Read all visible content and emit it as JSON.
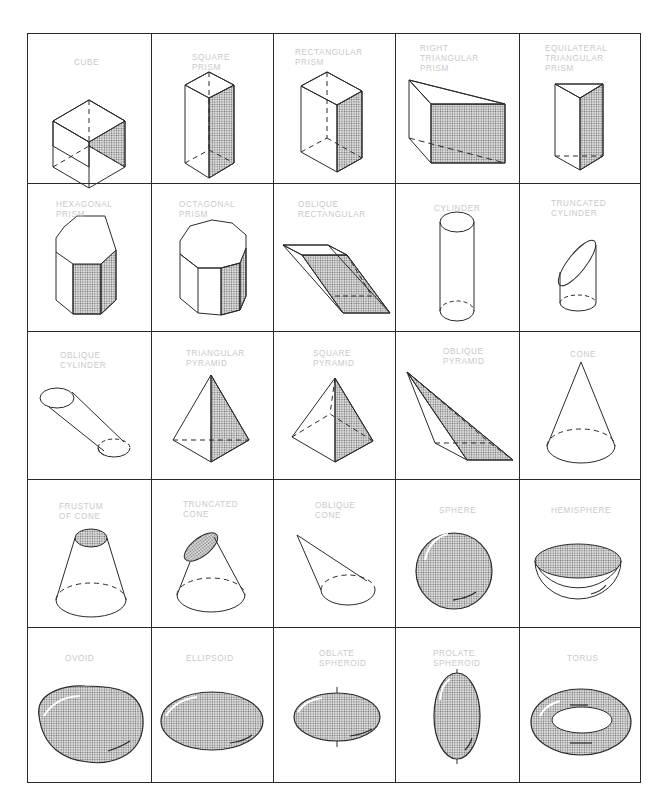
{
  "colors": {
    "line": "#2a2a2a",
    "label": "#c9c9c9",
    "stipple": "#6b6b6b",
    "background": "#ffffff"
  },
  "grid": {
    "rows": 5,
    "columns": 5
  },
  "cells": [
    {
      "row": 0,
      "col": 0,
      "label": "CUBE",
      "shape": "cube"
    },
    {
      "row": 0,
      "col": 1,
      "label": "SQUARE\nPRISM",
      "shape": "square-prism"
    },
    {
      "row": 0,
      "col": 2,
      "label": "RECTANGULAR\nPRISM",
      "shape": "rectangular-prism"
    },
    {
      "row": 0,
      "col": 3,
      "label": "RIGHT\nTRIANGULAR\nPRISM",
      "shape": "right-triangular-prism"
    },
    {
      "row": 0,
      "col": 4,
      "label": "EQUILATERAL\nTRIANGULAR\nPRISM",
      "shape": "equilateral-triangular-prism"
    },
    {
      "row": 1,
      "col": 0,
      "label": "HEXAGONAL\nPRISM",
      "shape": "hexagonal-prism"
    },
    {
      "row": 1,
      "col": 1,
      "label": "OCTAGONAL\nPRISM",
      "shape": "octagonal-prism"
    },
    {
      "row": 1,
      "col": 2,
      "label": "OBLIQUE\nRECTANGULAR",
      "shape": "oblique-rectangular"
    },
    {
      "row": 1,
      "col": 3,
      "label": "CYLINDER",
      "shape": "cylinder"
    },
    {
      "row": 1,
      "col": 4,
      "label": "TRUNCATED\nCYLINDER",
      "shape": "truncated-cylinder"
    },
    {
      "row": 2,
      "col": 0,
      "label": "OBLIQUE\nCYLINDER",
      "shape": "oblique-cylinder"
    },
    {
      "row": 2,
      "col": 1,
      "label": "TRIANGULAR\nPYRAMID",
      "shape": "triangular-pyramid"
    },
    {
      "row": 2,
      "col": 2,
      "label": "SQUARE\nPYRAMID",
      "shape": "square-pyramid"
    },
    {
      "row": 2,
      "col": 3,
      "label": "OBLIQUE\nPYRAMID",
      "shape": "oblique-pyramid"
    },
    {
      "row": 2,
      "col": 4,
      "label": "CONE",
      "shape": "cone"
    },
    {
      "row": 3,
      "col": 0,
      "label": "FRUSTUM\nOF CONE",
      "shape": "frustum-of-cone"
    },
    {
      "row": 3,
      "col": 1,
      "label": "TRUNCATED\nCONE",
      "shape": "truncated-cone"
    },
    {
      "row": 3,
      "col": 2,
      "label": "OBLIQUE\nCONE",
      "shape": "oblique-cone"
    },
    {
      "row": 3,
      "col": 3,
      "label": "SPHERE",
      "shape": "sphere"
    },
    {
      "row": 3,
      "col": 4,
      "label": "HEMISPHERE",
      "shape": "hemisphere"
    },
    {
      "row": 4,
      "col": 0,
      "label": "OVOID",
      "shape": "ovoid"
    },
    {
      "row": 4,
      "col": 1,
      "label": "ELLIPSOID",
      "shape": "ellipsoid"
    },
    {
      "row": 4,
      "col": 2,
      "label": "OBLATE\nSPHEROID",
      "shape": "oblate-spheroid"
    },
    {
      "row": 4,
      "col": 3,
      "label": "PROLATE\nSPHEROID",
      "shape": "prolate-spheroid"
    },
    {
      "row": 4,
      "col": 4,
      "label": "TORUS",
      "shape": "torus"
    }
  ]
}
